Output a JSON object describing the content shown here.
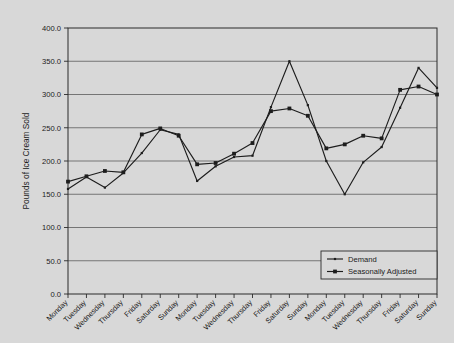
{
  "chart_data": {
    "type": "line",
    "title": "",
    "xlabel": "",
    "ylabel": "Pounds of Ice Cream Sold",
    "ylim": [
      0,
      400
    ],
    "ytick_step": 50,
    "ytick_labels": [
      "0.0",
      "50.0",
      "100.0",
      "150.0",
      "200.0",
      "250.0",
      "300.0",
      "350.0",
      "400.0"
    ],
    "grid": true,
    "legend_position": "bottom-right",
    "categories": [
      "Monday",
      "Tuesday",
      "Wednesday",
      "Thursday",
      "Friday",
      "Saturday",
      "Sunday",
      "Monday",
      "Tuesday",
      "Wednesday",
      "Thursday",
      "Friday",
      "Saturday",
      "Sunday",
      "Monday",
      "Tuesday",
      "Wednesday",
      "Thursday",
      "Friday",
      "Saturday",
      "Sunday"
    ],
    "series": [
      {
        "name": "Demand",
        "marker": "small-dot",
        "color": "#1d1d1d",
        "values": [
          158,
          176,
          160,
          182,
          212,
          247,
          240,
          170,
          192,
          206,
          208,
          281,
          350,
          284,
          200,
          150,
          198,
          221,
          280,
          340,
          310
        ]
      },
      {
        "name": "Seasonally Adjusted",
        "marker": "square",
        "color": "#1d1d1d",
        "values": [
          169,
          177,
          185,
          183,
          240,
          249,
          238,
          195,
          197,
          211,
          227,
          275,
          279,
          268,
          219,
          225,
          238,
          234,
          307,
          312,
          300
        ]
      }
    ]
  },
  "legend": {
    "entries": [
      {
        "label": "Demand"
      },
      {
        "label": "Seasonally Adjusted"
      }
    ]
  },
  "colors": {
    "background": "#d8d8d8",
    "plot_background": "#d8d8d8",
    "line": "#1d1d1d",
    "grid": "#4a4a4a",
    "frame": "#2a2a2a"
  }
}
